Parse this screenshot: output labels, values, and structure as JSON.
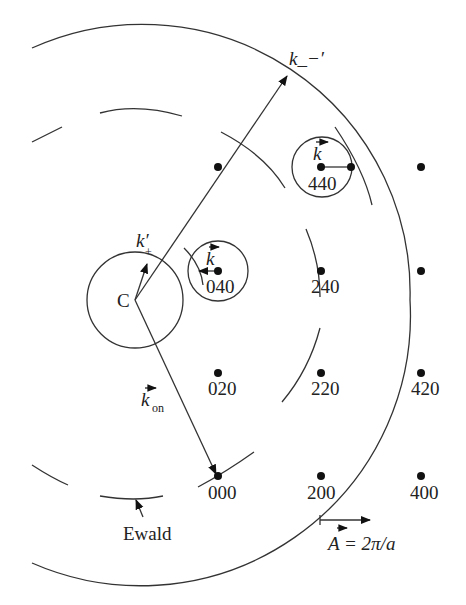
{
  "diagram": {
    "type": "reciprocal-lattice Ewald-sphere construction",
    "center_label": "C",
    "ewald_label": "Ewald",
    "vectors": {
      "k_minus_prime": "k_−′",
      "k_plus_prime_main": "k′",
      "k_plus_prime_sub": "+",
      "k_on_main": "k",
      "k_on_sub": "on",
      "k_small_040": "k",
      "k_small_440": "k"
    },
    "scale_bar": {
      "label_A": "A",
      "label_eq": " = 2π/a"
    },
    "lattice_points": [
      {
        "hkl": "000",
        "label": "000",
        "labeled": true
      },
      {
        "hkl": "200",
        "label": "200",
        "labeled": true
      },
      {
        "hkl": "400",
        "label": "400",
        "labeled": true
      },
      {
        "hkl": "020",
        "label": "020",
        "labeled": true
      },
      {
        "hkl": "220",
        "label": "220",
        "labeled": true
      },
      {
        "hkl": "420",
        "label": "420",
        "labeled": true
      },
      {
        "hkl": "040",
        "label": "040",
        "labeled": true
      },
      {
        "hkl": "240",
        "label": "240",
        "labeled": true
      },
      {
        "hkl": "440",
        "label": "",
        "labeled": false
      },
      {
        "hkl": "060",
        "label": "",
        "labeled": false
      },
      {
        "hkl": "460",
        "label": "440",
        "labeled": true
      },
      {
        "hkl": "660",
        "label": "",
        "labeled": false
      }
    ],
    "labels": {
      "p000": "000",
      "p200": "200",
      "p400": "400",
      "p020": "020",
      "p220": "220",
      "p420": "420",
      "p040": "040",
      "p240": "240",
      "p440": "440"
    },
    "colors": {
      "line": "#333333",
      "dot": "#111111",
      "text": "#222222",
      "background": "#ffffff"
    }
  }
}
